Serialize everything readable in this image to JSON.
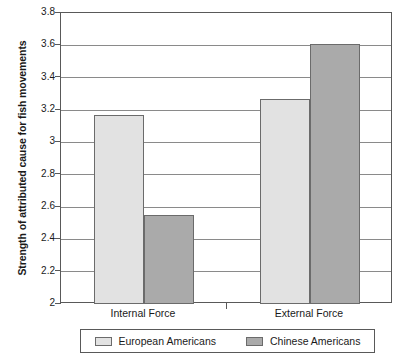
{
  "chart_data": {
    "type": "bar",
    "title": "",
    "xlabel": "",
    "ylabel": "Strength of attributed cause for fish movements",
    "categories": [
      "Internal Force",
      "External Force"
    ],
    "series": [
      {
        "name": "European Americans",
        "values": [
          3.17,
          3.27
        ],
        "color": "#e2e2e2"
      },
      {
        "name": "Chinese Americans",
        "values": [
          2.55,
          3.61
        ],
        "color": "#aaaaaa"
      }
    ],
    "ylim": [
      2,
      3.8
    ],
    "ytick_labels": [
      "3.8",
      "3.6",
      "3.4",
      "3.2",
      "3",
      "2.8",
      "2.6",
      "2.4",
      "2.2",
      "2"
    ],
    "ytick_values": [
      3.8,
      3.6,
      3.4,
      3.2,
      3.0,
      2.8,
      2.6,
      2.4,
      2.2,
      2.0
    ],
    "grid": true,
    "legend_position": "bottom",
    "bar_border_color": "#6b6b6b",
    "axis_color": "#595959",
    "grid_color": "#8a8a8a"
  }
}
